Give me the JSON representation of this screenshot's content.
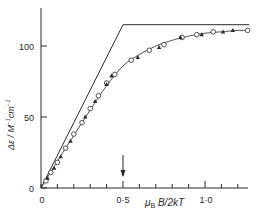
{
  "chart_data": {
    "type": "scatter",
    "title": "",
    "xlabel": "μB B/2kT",
    "ylabel": "Δε / M⁻¹cm⁻¹",
    "xlim": [
      0,
      1.28
    ],
    "ylim": [
      0,
      125
    ],
    "x_ticks": [
      0,
      0.1,
      0.2,
      0.3,
      0.4,
      0.5,
      0.6,
      0.7,
      0.8,
      0.9,
      1.0,
      1.1,
      1.2
    ],
    "x_tick_labels": [
      {
        "value": 0,
        "label": "0"
      },
      {
        "value": 0.5,
        "label": "0·5"
      },
      {
        "value": 1.0,
        "label": "1·0"
      }
    ],
    "y_ticks": [
      0,
      50,
      100
    ],
    "y_tick_labels": [
      {
        "value": 0,
        "label": "0"
      },
      {
        "value": 50,
        "label": "50"
      },
      {
        "value": 100,
        "label": "100"
      }
    ],
    "grid": false,
    "annotations": [
      {
        "type": "arrow",
        "x": 0.5,
        "description": "downward arrow marking x = 0.5"
      }
    ],
    "series": [
      {
        "name": "theoretical limit",
        "kind": "line",
        "x": [
          0,
          0.5,
          1.27
        ],
        "y": [
          0,
          115,
          115
        ]
      },
      {
        "name": "fitted curve",
        "kind": "line",
        "x": [
          0,
          0.1,
          0.2,
          0.3,
          0.4,
          0.5,
          0.6,
          0.7,
          0.8,
          0.9,
          1.0,
          1.1,
          1.2,
          1.26
        ],
        "y": [
          0,
          19,
          37,
          55,
          72,
          86,
          94,
          100,
          104,
          107,
          109,
          110,
          111,
          111
        ]
      },
      {
        "name": "open circles",
        "kind": "scatter",
        "marker": "open-circle",
        "x": [
          0.03,
          0.06,
          0.1,
          0.15,
          0.2,
          0.25,
          0.3,
          0.35,
          0.4,
          0.45,
          0.55,
          0.66,
          0.75,
          0.86,
          0.95,
          1.05,
          1.26
        ],
        "y": [
          5,
          11,
          18,
          28,
          38,
          46,
          56,
          65,
          74,
          80,
          90,
          97,
          101,
          106,
          108,
          110,
          111
        ]
      },
      {
        "name": "filled symbols",
        "kind": "scatter",
        "marker": "filled-triangle",
        "x": [
          0.04,
          0.08,
          0.12,
          0.18,
          0.27,
          0.33,
          0.4,
          0.43,
          0.59,
          0.72,
          0.85,
          0.98,
          1.11,
          1.17
        ],
        "y": [
          7,
          14,
          22,
          33,
          50,
          61,
          73,
          79,
          92,
          99,
          106,
          108,
          110,
          111
        ]
      }
    ]
  },
  "labels": {
    "y_axis": "Δε / M",
    "y_axis_sup1": "−1",
    "y_axis_mid": "cm",
    "y_axis_sup2": "−1",
    "x_axis_mu": "μ",
    "x_axis_sub": "B",
    "x_axis_rest": " B/2kT",
    "y_tick_0": "0",
    "y_tick_50": "50",
    "y_tick_100": "100",
    "x_tick_0": "0",
    "x_tick_05": "0·5",
    "x_tick_10": "1·0"
  },
  "colors": {
    "ink": "#2a2a2a",
    "background": "#ffffff"
  }
}
